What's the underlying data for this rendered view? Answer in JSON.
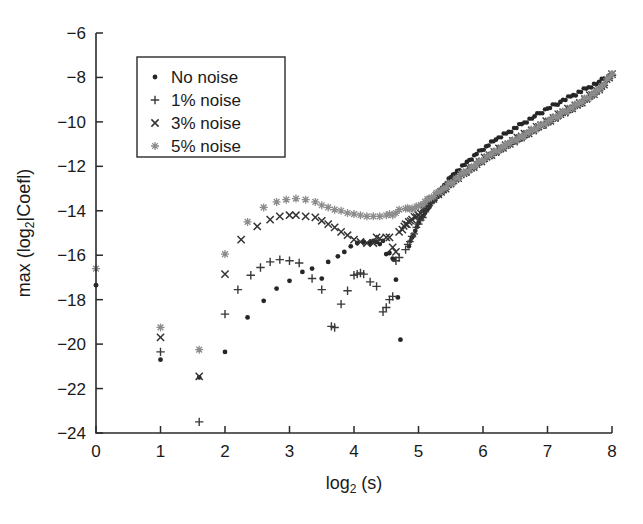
{
  "chart_data": {
    "type": "scatter",
    "title": "",
    "xlabel": "log2 (s)",
    "xlabel_base": "log",
    "xlabel_sub": "2",
    "xlabel_tail": " (s)",
    "ylabel": "max (log2|Coefl)",
    "ylabel_head": "max (log",
    "ylabel_sub": "2",
    "ylabel_tail": "|Coefl)",
    "xlim": [
      0,
      8
    ],
    "ylim": [
      -24,
      -6
    ],
    "xticks": [
      0,
      1,
      2,
      3,
      4,
      5,
      6,
      7,
      8
    ],
    "yticks": [
      -6,
      -8,
      -10,
      -12,
      -14,
      -16,
      -18,
      -20,
      -22,
      -24
    ],
    "xtick_labels": [
      "0",
      "1",
      "2",
      "3",
      "4",
      "5",
      "6",
      "7",
      "8"
    ],
    "ytick_labels": [
      "-6",
      "-8",
      "-10",
      "-12",
      "-14",
      "-16",
      "-18",
      "-20",
      "-22",
      "-24"
    ],
    "grid": false,
    "legend_position": "upper left",
    "series": [
      {
        "name": "No noise",
        "marker": "dot",
        "color": "#262626",
        "points": [
          [
            0.0,
            -17.35
          ],
          [
            1.0,
            -20.7
          ],
          [
            1.6,
            -21.5
          ],
          [
            2.0,
            -20.35
          ],
          [
            2.35,
            -18.8
          ],
          [
            2.6,
            -18.05
          ],
          [
            2.8,
            -17.5
          ],
          [
            3.0,
            -17.15
          ],
          [
            3.2,
            -16.75
          ],
          [
            3.35,
            -16.6
          ],
          [
            3.5,
            -17.05
          ],
          [
            3.6,
            -16.3
          ],
          [
            3.75,
            -16.05
          ],
          [
            3.85,
            -15.85
          ],
          [
            3.95,
            -15.6
          ],
          [
            4.05,
            -15.45
          ],
          [
            4.15,
            -15.4
          ],
          [
            4.25,
            -15.45
          ],
          [
            4.3,
            -15.35
          ],
          [
            4.35,
            -15.4
          ],
          [
            4.4,
            -15.5
          ],
          [
            4.45,
            -15.35
          ],
          [
            4.5,
            -15.95
          ],
          [
            4.55,
            -15.9
          ],
          [
            4.6,
            -16.15
          ],
          [
            4.62,
            -16.2
          ],
          [
            4.65,
            -17.1
          ],
          [
            4.68,
            -17.9
          ],
          [
            4.72,
            -19.8
          ],
          [
            4.85,
            -15.6
          ],
          [
            4.9,
            -15.2
          ],
          [
            4.95,
            -14.9
          ],
          [
            5.0,
            -14.55
          ],
          [
            5.05,
            -14.3
          ],
          [
            5.1,
            -14.1
          ],
          [
            5.15,
            -13.9
          ],
          [
            5.2,
            -13.6
          ],
          [
            5.3,
            -13.25
          ],
          [
            5.4,
            -12.85
          ],
          [
            5.5,
            -12.5
          ],
          [
            5.6,
            -12.2
          ],
          [
            5.75,
            -11.8
          ],
          [
            5.9,
            -11.45
          ],
          [
            6.05,
            -11.1
          ],
          [
            6.2,
            -10.8
          ],
          [
            6.4,
            -10.45
          ],
          [
            6.6,
            -10.1
          ],
          [
            6.8,
            -9.75
          ],
          [
            7.0,
            -9.4
          ],
          [
            7.2,
            -9.1
          ],
          [
            7.4,
            -8.8
          ],
          [
            7.6,
            -8.5
          ],
          [
            7.8,
            -8.2
          ],
          [
            8.0,
            -7.85
          ]
        ]
      },
      {
        "name": "1% noise",
        "marker": "plus",
        "color": "#3a3a3a",
        "points": [
          [
            1.0,
            -20.35
          ],
          [
            1.6,
            -23.5
          ],
          [
            2.0,
            -18.65
          ],
          [
            2.2,
            -17.55
          ],
          [
            2.4,
            -16.9
          ],
          [
            2.55,
            -16.55
          ],
          [
            2.7,
            -16.3
          ],
          [
            2.85,
            -16.2
          ],
          [
            3.0,
            -16.25
          ],
          [
            3.15,
            -16.35
          ],
          [
            3.35,
            -17.05
          ],
          [
            3.5,
            -17.55
          ],
          [
            3.65,
            -19.2
          ],
          [
            3.7,
            -19.25
          ],
          [
            3.8,
            -18.2
          ],
          [
            3.9,
            -17.6
          ],
          [
            4.0,
            -16.9
          ],
          [
            4.05,
            -16.85
          ],
          [
            4.1,
            -16.8
          ],
          [
            4.15,
            -16.85
          ],
          [
            4.25,
            -17.2
          ],
          [
            4.35,
            -17.4
          ],
          [
            4.45,
            -18.55
          ],
          [
            4.5,
            -18.35
          ],
          [
            4.55,
            -18.0
          ],
          [
            4.6,
            -17.85
          ],
          [
            4.65,
            -16.25
          ],
          [
            4.7,
            -16.1
          ],
          [
            4.8,
            -15.75
          ],
          [
            4.9,
            -15.15
          ],
          [
            5.0,
            -14.6
          ],
          [
            5.1,
            -14.05
          ],
          [
            5.2,
            -13.6
          ],
          [
            5.35,
            -13.2
          ],
          [
            5.5,
            -12.8
          ],
          [
            5.7,
            -12.35
          ],
          [
            5.9,
            -11.95
          ],
          [
            6.1,
            -11.55
          ],
          [
            6.35,
            -11.1
          ],
          [
            6.6,
            -10.7
          ],
          [
            6.9,
            -10.2
          ],
          [
            7.2,
            -9.7
          ],
          [
            7.5,
            -9.2
          ],
          [
            7.8,
            -8.6
          ],
          [
            8.0,
            -7.9
          ]
        ]
      },
      {
        "name": "3% noise",
        "marker": "cross",
        "color": "#333333",
        "points": [
          [
            1.0,
            -19.7
          ],
          [
            1.6,
            -21.45
          ],
          [
            2.0,
            -16.85
          ],
          [
            2.25,
            -15.3
          ],
          [
            2.5,
            -14.7
          ],
          [
            2.7,
            -14.4
          ],
          [
            2.85,
            -14.25
          ],
          [
            3.0,
            -14.2
          ],
          [
            3.1,
            -14.2
          ],
          [
            3.25,
            -14.25
          ],
          [
            3.4,
            -14.3
          ],
          [
            3.5,
            -14.45
          ],
          [
            3.6,
            -14.6
          ],
          [
            3.7,
            -14.75
          ],
          [
            3.8,
            -14.95
          ],
          [
            3.9,
            -15.1
          ],
          [
            4.0,
            -15.3
          ],
          [
            4.1,
            -15.4
          ],
          [
            4.2,
            -15.45
          ],
          [
            4.3,
            -15.45
          ],
          [
            4.35,
            -15.2
          ],
          [
            4.4,
            -15.25
          ],
          [
            4.5,
            -15.2
          ],
          [
            4.55,
            -15.2
          ],
          [
            4.6,
            -15.65
          ],
          [
            4.65,
            -15.85
          ],
          [
            4.7,
            -14.95
          ],
          [
            4.75,
            -14.85
          ],
          [
            4.8,
            -14.6
          ],
          [
            4.85,
            -14.5
          ],
          [
            4.9,
            -14.4
          ],
          [
            5.0,
            -14.2
          ],
          [
            5.1,
            -13.85
          ],
          [
            5.2,
            -13.5
          ],
          [
            5.35,
            -13.15
          ],
          [
            5.5,
            -12.75
          ],
          [
            5.7,
            -12.3
          ],
          [
            5.9,
            -11.9
          ],
          [
            6.1,
            -11.5
          ],
          [
            6.35,
            -11.05
          ],
          [
            6.6,
            -10.65
          ],
          [
            6.9,
            -10.15
          ],
          [
            7.2,
            -9.65
          ],
          [
            7.5,
            -9.15
          ],
          [
            7.8,
            -8.55
          ],
          [
            8.0,
            -7.85
          ]
        ]
      },
      {
        "name": "5% noise",
        "marker": "asterisk",
        "color": "#8c8c8c",
        "points": [
          [
            0.0,
            -16.6
          ],
          [
            1.0,
            -19.25
          ],
          [
            1.6,
            -20.25
          ],
          [
            2.0,
            -15.95
          ],
          [
            2.35,
            -14.5
          ],
          [
            2.6,
            -13.85
          ],
          [
            2.8,
            -13.6
          ],
          [
            2.95,
            -13.5
          ],
          [
            3.1,
            -13.45
          ],
          [
            3.25,
            -13.5
          ],
          [
            3.4,
            -13.6
          ],
          [
            3.5,
            -13.75
          ],
          [
            3.6,
            -13.85
          ],
          [
            3.7,
            -13.95
          ],
          [
            3.8,
            -14.0
          ],
          [
            3.9,
            -14.1
          ],
          [
            4.0,
            -14.15
          ],
          [
            4.1,
            -14.2
          ],
          [
            4.2,
            -14.25
          ],
          [
            4.3,
            -14.25
          ],
          [
            4.4,
            -14.25
          ],
          [
            4.5,
            -14.2
          ],
          [
            4.55,
            -14.15
          ],
          [
            4.6,
            -14.2
          ],
          [
            4.65,
            -14.1
          ],
          [
            4.7,
            -13.95
          ],
          [
            4.8,
            -13.9
          ],
          [
            4.9,
            -13.9
          ],
          [
            5.0,
            -13.8
          ],
          [
            5.1,
            -13.6
          ],
          [
            5.2,
            -13.4
          ],
          [
            5.35,
            -13.1
          ],
          [
            5.5,
            -12.75
          ],
          [
            5.7,
            -12.3
          ],
          [
            5.9,
            -11.9
          ],
          [
            6.1,
            -11.5
          ],
          [
            6.35,
            -11.05
          ],
          [
            6.6,
            -10.65
          ],
          [
            6.9,
            -10.15
          ],
          [
            7.2,
            -9.65
          ],
          [
            7.5,
            -9.15
          ],
          [
            7.8,
            -8.55
          ],
          [
            8.0,
            -7.85
          ]
        ]
      }
    ]
  },
  "legend": {
    "entries": [
      {
        "marker": "dot",
        "label": "No noise",
        "color": "#262626"
      },
      {
        "marker": "plus",
        "label": "1% noise",
        "color": "#3a3a3a"
      },
      {
        "marker": "cross",
        "label": "3% noise",
        "color": "#333333"
      },
      {
        "marker": "asterisk",
        "label": "5% noise",
        "color": "#8c8c8c"
      }
    ]
  },
  "colors": {
    "axis": "#2a2a2a",
    "background": "#ffffff",
    "text": "#1a1a1a"
  }
}
